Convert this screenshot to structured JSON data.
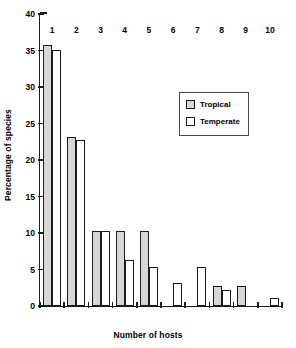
{
  "chart_data": {
    "type": "bar",
    "title": "",
    "xlabel": "Number of hosts",
    "ylabel": "Percentage of species",
    "categories": [
      "1",
      "2",
      "3",
      "4",
      "5",
      "6",
      "7",
      "8",
      "9",
      "10"
    ],
    "series": [
      {
        "name": "Tropical",
        "color": "#d6d6d6",
        "values": [
          35.8,
          23.1,
          10.3,
          10.3,
          10.3,
          0,
          0,
          2.7,
          2.7,
          0
        ]
      },
      {
        "name": "Temperate",
        "color": "#ffffff",
        "values": [
          35.1,
          22.8,
          10.3,
          6.3,
          5.3,
          3.2,
          5.3,
          2.2,
          0,
          1.1
        ]
      }
    ],
    "ylim": [
      0,
      40
    ],
    "yticks": [
      0,
      5,
      10,
      15,
      20,
      25,
      30,
      35,
      40
    ],
    "ytick_labels": [
      "0",
      "5",
      "10",
      "15",
      "20",
      "25",
      "30",
      "35",
      "40"
    ],
    "grid": false,
    "legend_position": "upper-center",
    "axis_color": "#1a1a1a",
    "bar_edge_color": "#1a1a1a",
    "background": "#ffffff"
  },
  "legend": {
    "entries": [
      {
        "label": "Tropical"
      },
      {
        "label": "Temperate"
      }
    ]
  }
}
